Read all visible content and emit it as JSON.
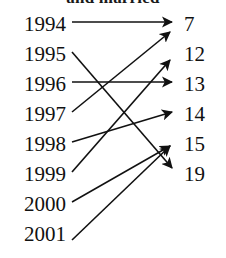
{
  "caption": {
    "text": "and married",
    "note": "partially cropped at top edge of image"
  },
  "diagram": {
    "type": "bipartite-mapping",
    "left_label": "years",
    "right_label": "values",
    "left_nodes": [
      {
        "id": "y1994",
        "label": "1994",
        "x": 66,
        "y": 25
      },
      {
        "id": "y1995",
        "label": "1995",
        "x": 66,
        "y": 55
      },
      {
        "id": "y1996",
        "label": "1996",
        "x": 66,
        "y": 85
      },
      {
        "id": "y1997",
        "label": "1997",
        "x": 66,
        "y": 115
      },
      {
        "id": "y1998",
        "label": "1998",
        "x": 66,
        "y": 145
      },
      {
        "id": "y1999",
        "label": "1999",
        "x": 66,
        "y": 175
      },
      {
        "id": "y2000",
        "label": "2000",
        "x": 66,
        "y": 205
      },
      {
        "id": "y2001",
        "label": "2001",
        "x": 66,
        "y": 235
      }
    ],
    "right_nodes": [
      {
        "id": "v7",
        "label": "7",
        "x": 184,
        "y": 25
      },
      {
        "id": "v12",
        "label": "12",
        "x": 184,
        "y": 55
      },
      {
        "id": "v13",
        "label": "13",
        "x": 184,
        "y": 85
      },
      {
        "id": "v14",
        "label": "14",
        "x": 184,
        "y": 115
      },
      {
        "id": "v15",
        "label": "15",
        "x": 184,
        "y": 145
      },
      {
        "id": "v19",
        "label": "19",
        "x": 184,
        "y": 175
      }
    ],
    "edges": [
      {
        "id": "e1",
        "from": "1994",
        "to": "7",
        "x1": 72,
        "y1": 22,
        "x2": 172,
        "y2": 22
      },
      {
        "id": "e2",
        "from": "1995",
        "to": "19",
        "x1": 72,
        "y1": 52,
        "x2": 172,
        "y2": 168
      },
      {
        "id": "e3",
        "from": "1996",
        "to": "13",
        "x1": 72,
        "y1": 82,
        "x2": 172,
        "y2": 82
      },
      {
        "id": "e4",
        "from": "1997",
        "to": "7",
        "x1": 72,
        "y1": 112,
        "x2": 170,
        "y2": 32
      },
      {
        "id": "e5",
        "from": "1998",
        "to": "14",
        "x1": 72,
        "y1": 142,
        "x2": 172,
        "y2": 112
      },
      {
        "id": "e6",
        "from": "1999",
        "to": "12",
        "x1": 72,
        "y1": 172,
        "x2": 170,
        "y2": 60
      },
      {
        "id": "e7",
        "from": "2000",
        "to": "15",
        "x1": 72,
        "y1": 202,
        "x2": 170,
        "y2": 146
      },
      {
        "id": "e8",
        "from": "2001",
        "to": "15",
        "x1": 72,
        "y1": 240,
        "x2": 170,
        "y2": 146
      }
    ],
    "colors": {
      "ink": "#111111",
      "background": "#ffffff"
    }
  }
}
